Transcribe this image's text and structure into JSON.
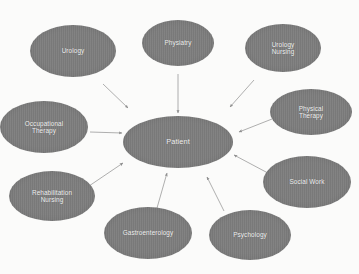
{
  "diagram": {
    "type": "hub-and-spoke concept map",
    "background_color": "#fbfbfa",
    "node_fill_color": "#7d7d7d",
    "node_text_color": "#f2f2f2",
    "edge_color": "#9a9a9a",
    "hub": {
      "id": "patient",
      "label": "Patient",
      "cx": 178,
      "cy": 142,
      "rx": 55,
      "ry": 26
    },
    "spokes": [
      {
        "id": "urology",
        "label": "Urology",
        "cx": 73,
        "cy": 51,
        "rx": 43,
        "ry": 26,
        "arrow_to": "patient"
      },
      {
        "id": "physiatry",
        "label": "Physiatry",
        "cx": 178,
        "cy": 43,
        "rx": 36,
        "ry": 23,
        "arrow_to": "patient"
      },
      {
        "id": "urology-nursing",
        "label": "Urology\nNursing",
        "cx": 283,
        "cy": 48,
        "rx": 38,
        "ry": 24,
        "arrow_to": "patient"
      },
      {
        "id": "physical-therapy",
        "label": "Physical\nTherapy",
        "cx": 311,
        "cy": 112,
        "rx": 41,
        "ry": 23,
        "arrow_to": "patient"
      },
      {
        "id": "social-work",
        "label": "Social Work",
        "cx": 307,
        "cy": 182,
        "rx": 44,
        "ry": 26,
        "arrow_to": "patient"
      },
      {
        "id": "psychology",
        "label": "Psychology",
        "cx": 250,
        "cy": 235,
        "rx": 41,
        "ry": 25,
        "arrow_to": "patient"
      },
      {
        "id": "gastroenterology",
        "label": "Gastroenterology",
        "cx": 148,
        "cy": 233,
        "rx": 44,
        "ry": 26,
        "arrow_to": "patient"
      },
      {
        "id": "rehabilitation-nursing",
        "label": "Rehabilitation\nNursing",
        "cx": 52,
        "cy": 196,
        "rx": 43,
        "ry": 25,
        "arrow_to": "patient"
      },
      {
        "id": "occupational-therapy",
        "label": "Occupational\nTherapy",
        "cx": 44,
        "cy": 127,
        "rx": 44,
        "ry": 26,
        "arrow_to": "patient"
      }
    ],
    "edges": [
      {
        "from": "urology",
        "to": "patient",
        "x1": 103,
        "y1": 84,
        "x2": 128,
        "y2": 108
      },
      {
        "from": "physiatry",
        "to": "patient",
        "x1": 178,
        "y1": 74,
        "x2": 178,
        "y2": 113
      },
      {
        "from": "urology-nursing",
        "to": "patient",
        "x1": 254,
        "y1": 80,
        "x2": 230,
        "y2": 107
      },
      {
        "from": "physical-therapy",
        "to": "patient",
        "x1": 272,
        "y1": 119,
        "x2": 239,
        "y2": 132
      },
      {
        "from": "social-work",
        "to": "patient",
        "x1": 266,
        "y1": 172,
        "x2": 234,
        "y2": 155
      },
      {
        "from": "psychology",
        "to": "patient",
        "x1": 224,
        "y1": 211,
        "x2": 207,
        "y2": 177
      },
      {
        "from": "gastroenterology",
        "to": "patient",
        "x1": 157,
        "y1": 208,
        "x2": 167,
        "y2": 173
      },
      {
        "from": "rehabilitation-nursing",
        "to": "patient",
        "x1": 89,
        "y1": 186,
        "x2": 123,
        "y2": 163
      },
      {
        "from": "occupational-therapy",
        "to": "patient",
        "x1": 90,
        "y1": 132,
        "x2": 122,
        "y2": 133
      }
    ]
  }
}
